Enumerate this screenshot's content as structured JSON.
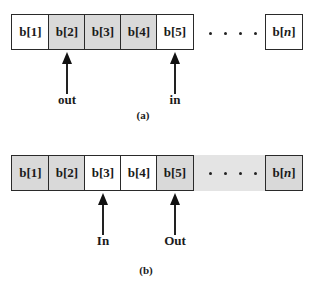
{
  "colors": {
    "shaded": "#d9d9d9",
    "band": "#e4e4e4",
    "border": "#2a2a2a",
    "text": "#1a1a1a"
  },
  "panel_a": {
    "caption": "(a)",
    "cells": [
      {
        "label": "b[1]",
        "shaded": false
      },
      {
        "label": "b[2]",
        "shaded": true
      },
      {
        "label": "b[3]",
        "shaded": true
      },
      {
        "label": "b[4]",
        "shaded": true
      },
      {
        "label": "b[5]",
        "shaded": false
      }
    ],
    "ellipsis": "....",
    "last_cell": {
      "prefix": "b[",
      "index": "n",
      "suffix": "]",
      "shaded": false
    },
    "pointers": [
      {
        "label": "out",
        "points_to": "b[2]"
      },
      {
        "label": "in",
        "points_to": "b[5]"
      }
    ]
  },
  "panel_b": {
    "caption": "(b)",
    "cells": [
      {
        "label": "b[1]",
        "shaded": true
      },
      {
        "label": "b[2]",
        "shaded": true
      },
      {
        "label": "b[3]",
        "shaded": false
      },
      {
        "label": "b[4]",
        "shaded": false
      },
      {
        "label": "b[5]",
        "shaded": true
      }
    ],
    "ellipsis": "....",
    "last_cell": {
      "prefix": "b[",
      "index": "n",
      "suffix": "]",
      "shaded": true
    },
    "pointers": [
      {
        "label": "In",
        "points_to": "b[3]"
      },
      {
        "label": "Out",
        "points_to": "b[5]"
      }
    ]
  }
}
